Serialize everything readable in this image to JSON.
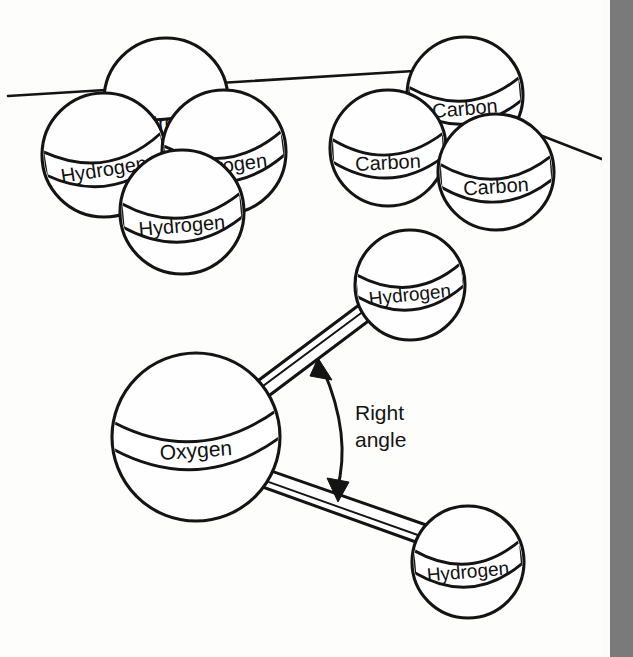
{
  "figure": {
    "kind": "molecular-ball-and-stick-diagram",
    "caption_text": "",
    "background_color": "#fdfdfb",
    "ink_color": "#141414",
    "margin_strip_color": "#7a7a7a"
  },
  "clusters": {
    "hydrogen_cluster": {
      "name": "hydrogen-atom-cluster",
      "atom_count": 4,
      "atoms": [
        {
          "label": "Hydrogen",
          "cx": 166,
          "cy": 100,
          "r": 62,
          "band_font_size": 20,
          "band_rotation": -7,
          "occluded": true
        },
        {
          "label": "Hydrogen",
          "cx": 104,
          "cy": 155,
          "r": 62,
          "band_font_size": 20,
          "band_rotation": -9,
          "occluded": false
        },
        {
          "label": "Hydrogen",
          "cx": 224,
          "cy": 152,
          "r": 62,
          "band_font_size": 20,
          "band_rotation": -7,
          "occluded": false
        },
        {
          "label": "Hydrogen",
          "cx": 182,
          "cy": 212,
          "r": 62,
          "band_font_size": 20,
          "band_rotation": -5,
          "occluded": false
        }
      ]
    },
    "carbon_cluster": {
      "name": "carbon-atom-cluster",
      "atom_count": 3,
      "atoms": [
        {
          "label": "Carbon",
          "cx": 465,
          "cy": 95,
          "r": 58,
          "band_font_size": 20,
          "band_rotation": -5,
          "occluded": false
        },
        {
          "label": "Carbon",
          "cx": 388,
          "cy": 148,
          "r": 58,
          "band_font_size": 20,
          "band_rotation": -3,
          "occluded": false
        },
        {
          "label": "Carbon",
          "cx": 496,
          "cy": 172,
          "r": 58,
          "band_font_size": 20,
          "band_rotation": -4,
          "occluded": false
        }
      ]
    },
    "water_molecule": {
      "name": "water-molecule-model",
      "atoms": [
        {
          "label": "Oxygen",
          "cx": 196,
          "cy": 437,
          "r": 84,
          "band_font_size": 21,
          "band_rotation": -4,
          "role": "central"
        },
        {
          "label": "Hydrogen",
          "cx": 410,
          "cy": 285,
          "r": 55,
          "band_font_size": 19,
          "band_rotation": -6,
          "role": "terminal-upper"
        },
        {
          "label": "Hydrogen",
          "cx": 468,
          "cy": 562,
          "r": 56,
          "band_font_size": 19,
          "band_rotation": -5,
          "role": "terminal-lower"
        }
      ],
      "bonds": [
        {
          "name": "bond-oxygen-to-upper-hydrogen",
          "from": "Oxygen",
          "to": "Hydrogen"
        },
        {
          "name": "bond-oxygen-to-lower-hydrogen",
          "from": "Oxygen",
          "to": "Hydrogen"
        }
      ],
      "annotation": {
        "name": "right-angle-annotation",
        "line1": "Right",
        "line2": "angle",
        "x": 355,
        "y_line1": 413,
        "y_line2": 440,
        "arrow_style": "double-headed-arc"
      }
    }
  },
  "guide_lines": [
    {
      "name": "surface-line-left",
      "x1": 8,
      "y1": 96,
      "x2": 430,
      "y2": 70
    },
    {
      "name": "surface-line-right",
      "x1": 470,
      "y1": 108,
      "x2": 612,
      "y2": 163
    }
  ]
}
